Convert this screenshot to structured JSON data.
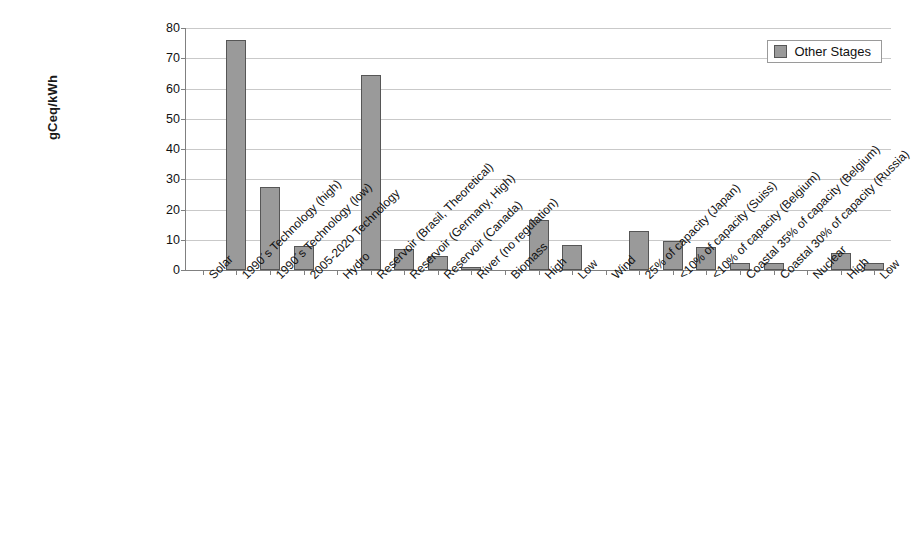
{
  "chart_data": {
    "type": "bar",
    "title": "",
    "xlabel": "",
    "ylabel": "gCeq/kWh",
    "ylim": [
      0,
      80
    ],
    "ytick_step": 10,
    "yticks": [
      0,
      10,
      20,
      30,
      40,
      50,
      60,
      70,
      80
    ],
    "grid": true,
    "legend_position": "top-right",
    "series": [
      {
        "name": "Other Stages",
        "color": "#9a9a9a",
        "values": [
          0,
          76,
          27.5,
          8,
          0,
          64.5,
          6.8,
          4.5,
          1,
          0,
          16.5,
          8.3,
          0,
          13,
          9.6,
          7.6,
          2.3,
          2.3,
          0,
          5.6,
          2.2
        ]
      }
    ],
    "categories": [
      "Solar",
      "1990´s Technology (high)",
      "1990´s Technology (low)",
      "2005-2020 Technology",
      "Hydro",
      "Reservoir (Brasil, Theoretical)",
      "Reservoir (Germany, High)",
      "Reservoir (Canada)",
      "River (no regulation)",
      "Biomass",
      "High",
      "Low",
      "Wind",
      "25% of capacity (Japan)",
      "<10% of capacity (Suiss)",
      "<10% of capacity (Belgium)",
      "Coastal 35% of capacity (Belgium)",
      "Coastal 30% of capacity (Russia)",
      "Nuclear",
      "High",
      "Low"
    ]
  },
  "legend": {
    "entries": [
      {
        "label": "Other Stages",
        "color": "#9a9a9a"
      }
    ]
  }
}
